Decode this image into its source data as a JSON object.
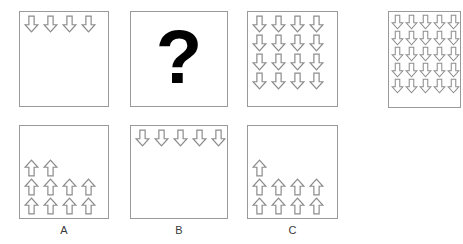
{
  "puzzle": {
    "type": "visual-analogy-sequence",
    "arrow_style": {
      "stroke_color": "#8c8c8c",
      "fill_color": "#ffffff",
      "stroke_width": 1
    },
    "question_symbol": "?"
  },
  "sequence": {
    "panels": [
      {
        "id": "panel-1",
        "position": 1,
        "content": "arrows",
        "direction": "down",
        "arrow_count": 4,
        "rows": [
          4
        ],
        "alignment": "top-center"
      },
      {
        "id": "panel-2",
        "position": 2,
        "content": "question-mark",
        "symbol": "?"
      },
      {
        "id": "panel-3",
        "position": 3,
        "content": "arrows",
        "direction": "down",
        "arrow_count": 16,
        "rows": [
          4,
          4,
          4,
          4
        ],
        "alignment": "top-left"
      },
      {
        "id": "panel-4",
        "position": 4,
        "content": "arrows",
        "direction": "down",
        "arrow_count": 25,
        "rows": [
          5,
          5,
          5,
          5,
          5
        ],
        "alignment": "top-left"
      }
    ]
  },
  "options": [
    {
      "id": "option-a",
      "label": "A",
      "content": "arrows",
      "direction": "up",
      "arrow_count": 10,
      "rows": [
        2,
        4,
        4
      ],
      "alignment": "bottom-left"
    },
    {
      "id": "option-b",
      "label": "B",
      "content": "arrows",
      "direction": "down",
      "arrow_count": 5,
      "rows": [
        5
      ],
      "alignment": "top-center"
    },
    {
      "id": "option-c",
      "label": "C",
      "content": "arrows",
      "direction": "up",
      "arrow_count": 9,
      "rows": [
        1,
        4,
        4
      ],
      "alignment": "bottom-left"
    }
  ]
}
